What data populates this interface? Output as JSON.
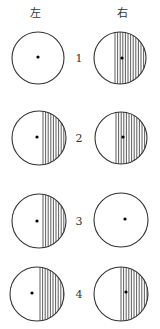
{
  "header": {
    "left_label": "左",
    "right_label": "右"
  },
  "colors": {
    "stroke": "#333333",
    "background": "#ffffff"
  },
  "rows": [
    {
      "number": "1",
      "left": {
        "cx": 38,
        "cy": 58,
        "r": 26,
        "dot": [
          38,
          57
        ],
        "hatch_from": null
      },
      "right": {
        "cx": 120,
        "cy": 58,
        "r": 26,
        "dot": [
          122,
          58
        ],
        "hatch_from": 115
      }
    },
    {
      "number": "2",
      "left": {
        "cx": 39,
        "cy": 138,
        "r": 27,
        "dot": [
          37,
          137
        ],
        "hatch_from": 43
      },
      "right": {
        "cx": 121,
        "cy": 138,
        "r": 26,
        "dot": [
          123,
          137
        ],
        "hatch_from": 116
      }
    },
    {
      "number": "3",
      "left": {
        "cx": 39,
        "cy": 221,
        "r": 27,
        "dot": [
          37,
          221
        ],
        "hatch_from": 43
      },
      "right": {
        "cx": 121,
        "cy": 220,
        "r": 27,
        "dot": [
          125,
          219
        ],
        "hatch_from": null
      }
    },
    {
      "number": "4",
      "left": {
        "cx": 37,
        "cy": 294,
        "r": 27,
        "dot": [
          32,
          293
        ],
        "hatch_from": 40
      },
      "right": {
        "cx": 121,
        "cy": 294,
        "r": 27,
        "dot": [
          126,
          292
        ],
        "hatch_from": 121
      }
    }
  ]
}
